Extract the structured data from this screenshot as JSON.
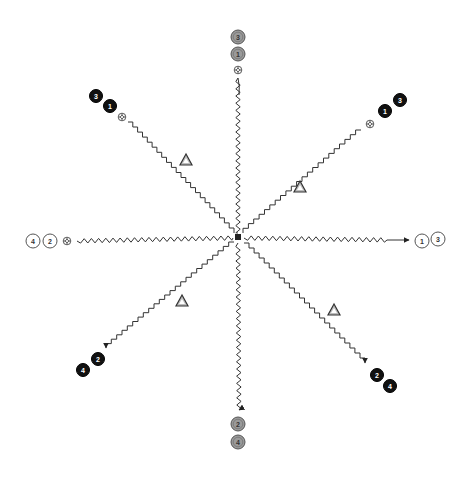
{
  "diagram": {
    "type": "drill-diagram",
    "center": {
      "x": 238,
      "y": 237
    },
    "colors": {
      "line": "#333333",
      "black_player": "#111111",
      "gray_player": "#9a9a9a",
      "white_player": "#ffffff",
      "cone_fill": "#bdbdbd",
      "cone_stroke": "#333333"
    },
    "groups": [
      {
        "id": "top",
        "team": "gray",
        "players": [
          {
            "label": "3",
            "x": 238,
            "y": 37
          },
          {
            "label": "1",
            "x": 238,
            "y": 54
          }
        ],
        "ball": {
          "x": 238,
          "y": 70
        },
        "path": {
          "style": "wavy",
          "from": "outer",
          "arrow": false
        }
      },
      {
        "id": "top-left",
        "team": "black",
        "players": [
          {
            "label": "3",
            "x": 96,
            "y": 96
          },
          {
            "label": "1",
            "x": 110,
            "y": 106
          }
        ],
        "ball": {
          "x": 122,
          "y": 117
        },
        "path": {
          "style": "staircase",
          "from": "outer",
          "arrow": false
        }
      },
      {
        "id": "top-right",
        "team": "black",
        "players": [
          {
            "label": "1",
            "x": 385,
            "y": 111
          },
          {
            "label": "3",
            "x": 400,
            "y": 100
          }
        ],
        "ball": {
          "x": 370,
          "y": 124
        },
        "path": {
          "style": "staircase",
          "from": "outer",
          "arrow": false
        }
      },
      {
        "id": "left",
        "team": "white",
        "players": [
          {
            "label": "4",
            "x": 33,
            "y": 241
          },
          {
            "label": "2",
            "x": 50,
            "y": 241
          }
        ],
        "ball": {
          "x": 67,
          "y": 241
        },
        "path": {
          "style": "wavy",
          "from": "outer",
          "arrow": false
        }
      },
      {
        "id": "right",
        "team": "white",
        "players": [
          {
            "label": "1",
            "x": 422,
            "y": 241
          },
          {
            "label": "3",
            "x": 438,
            "y": 239
          }
        ],
        "path": {
          "style": "wavy",
          "from": "center",
          "arrow": true
        }
      },
      {
        "id": "bottom-left",
        "team": "black",
        "players": [
          {
            "label": "4",
            "x": 83,
            "y": 370
          },
          {
            "label": "2",
            "x": 98,
            "y": 359
          }
        ],
        "path": {
          "style": "staircase",
          "from": "center",
          "arrow": true
        }
      },
      {
        "id": "bottom-right",
        "team": "black",
        "players": [
          {
            "label": "2",
            "x": 377,
            "y": 375
          },
          {
            "label": "4",
            "x": 390,
            "y": 386
          }
        ],
        "path": {
          "style": "staircase",
          "from": "center",
          "arrow": true
        }
      },
      {
        "id": "bottom",
        "team": "gray",
        "players": [
          {
            "label": "2",
            "x": 238,
            "y": 424
          },
          {
            "label": "4",
            "x": 238,
            "y": 442
          }
        ],
        "path": {
          "style": "wavy",
          "from": "center",
          "arrow": true
        }
      }
    ],
    "cones": [
      {
        "x": 186,
        "y": 160
      },
      {
        "x": 300,
        "y": 187
      },
      {
        "x": 182,
        "y": 301
      },
      {
        "x": 334,
        "y": 310
      }
    ]
  }
}
